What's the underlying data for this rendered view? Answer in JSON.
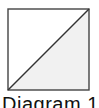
{
  "diagram": {
    "caption": "Diagram 1",
    "shape": "square-with-diagonal",
    "square": {
      "x": 8,
      "y": 9,
      "size": 81
    },
    "diagonal": "bottom-left to top-right",
    "shaded_region": "lower-right triangle",
    "colors": {
      "stroke": "#444444",
      "shade": "#f1f1f1",
      "background": "#ffffff"
    }
  }
}
